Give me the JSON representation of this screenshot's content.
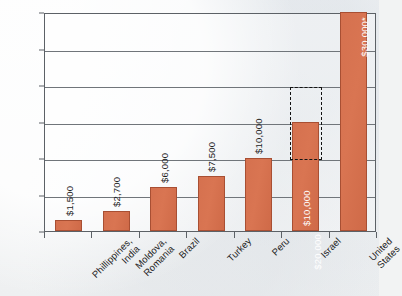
{
  "chart_data": {
    "type": "bar",
    "title": "",
    "subtitle": "",
    "xlabel": "",
    "ylabel": "",
    "ylim": [
      0,
      30000
    ],
    "ytick_labels": [
      "30,000",
      "25,000",
      "20,000",
      "15,000",
      "10,000",
      "5,000",
      "0"
    ],
    "ytick_values": [
      30000,
      25000,
      20000,
      15000,
      10000,
      5000,
      0
    ],
    "grid": true,
    "legend": "none",
    "categories": [
      "Phillippines,\nIndia",
      "Moldova,\nRomania",
      "Brazil",
      "Turkey",
      "Peru",
      "Israel",
      "United\nStates"
    ],
    "values": [
      1500,
      2700,
      6000,
      7500,
      10000,
      15000,
      30000
    ],
    "value_labels": [
      "$1,500",
      "$2,700",
      "$6,000",
      "$7,500",
      "$10,000",
      "$20,000",
      "$30,000*"
    ],
    "annotations": [
      {
        "category": "Israel",
        "kind": "dashed-range-box",
        "range_low": 10000,
        "range_high": 20000,
        "label_low": "$10,000",
        "label_high": "$20,000"
      }
    ],
    "colors": {
      "bar_fill": "#D5714F",
      "bar_stroke": "#A84F33",
      "gridline": "#70757A",
      "axis": "#5C6166",
      "annotation_box": "#141414",
      "background": "#F2F3F3",
      "text": "#1D1D1D",
      "inside_label_text": "#FFFFFF"
    }
  },
  "categories_display": [
    {
      "line1": "Phillippines,",
      "line2": "India"
    },
    {
      "line1": "Moldova,",
      "line2": "Romania"
    },
    {
      "line1": "Brazil",
      "line2": ""
    },
    {
      "line1": "Turkey",
      "line2": ""
    },
    {
      "line1": "Peru",
      "line2": ""
    },
    {
      "line1": "Israel",
      "line2": ""
    },
    {
      "line1": "United",
      "line2": "States"
    }
  ],
  "israel_labels": {
    "upper": "$20,000",
    "lower": "$10,000"
  }
}
